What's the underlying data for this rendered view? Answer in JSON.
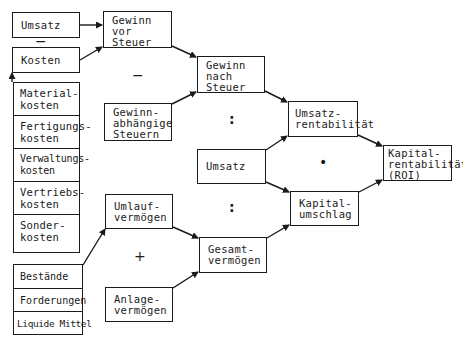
{
  "diagram": {
    "title": "",
    "colors": {
      "line": "#1a1a1a",
      "background": "#ffffff"
    },
    "nodes": {
      "umsatz_top": "Umsatz",
      "kosten": "Kosten",
      "cost_items": [
        "Material-\nkosten",
        "Fertigungs-\nkosten",
        "Verwaltungs-\nkosten",
        "Vertriebs-\nkosten",
        "Sonder-\nkosten"
      ],
      "gewinn_vor_steuer": "Gewinn\nvor\nSteuer",
      "gewinnabhaengige_steuern": "Gewinn-\nabhängige\nSteuern",
      "gewinn_nach_steuer": "Gewinn\nnach\nSteuer",
      "umsatz_mid": "Umsatz",
      "umsatzrentabilitaet": "Umsatz-\nrentabilität",
      "kapitalumschlag": "Kapital-\numschlag",
      "kapitalrentabilitaet": "Kapital-\nrentabilität\n(ROI)",
      "umlaufvermoegen": "Umlauf-\nvermögen",
      "anlagevermoegen": "Anlage-\nvermögen",
      "gesamtvermoegen": "Gesamt-\nvermögen",
      "asset_items": [
        "Bestände",
        "Forderungen",
        "Liquide Mittel"
      ]
    },
    "operators": {
      "umsatz_minus_kosten": "−",
      "gewinn_minus_steuern": "−",
      "gewinn_div_umsatz": ":",
      "umsatz_div_vermoegen": ":",
      "rentab_times_umschlag": "•",
      "umlauf_plus_anlage": "+"
    },
    "edges": [
      [
        "Umsatz",
        "Gewinn vor Steuer"
      ],
      [
        "Kosten",
        "Gewinn vor Steuer"
      ],
      [
        "Kostenarten",
        "Kosten"
      ],
      [
        "Gewinn vor Steuer",
        "Gewinn nach Steuer"
      ],
      [
        "Gewinnabhängige Steuern",
        "Gewinn nach Steuer"
      ],
      [
        "Gewinn nach Steuer",
        "Umsatzrentabilität"
      ],
      [
        "Umsatz",
        "Umsatzrentabilität"
      ],
      [
        "Umsatz",
        "Kapitalumschlag"
      ],
      [
        "Umsatzrentabilität",
        "Kapitalrentabilität (ROI)"
      ],
      [
        "Kapitalumschlag",
        "Kapitalrentabilität (ROI)"
      ],
      [
        "Umlaufvermögensposten",
        "Umlaufvermögen"
      ],
      [
        "Umlaufvermögen",
        "Gesamtvermögen"
      ],
      [
        "Anlagevermögen",
        "Gesamtvermögen"
      ],
      [
        "Gesamtvermögen",
        "Kapitalumschlag"
      ]
    ]
  }
}
